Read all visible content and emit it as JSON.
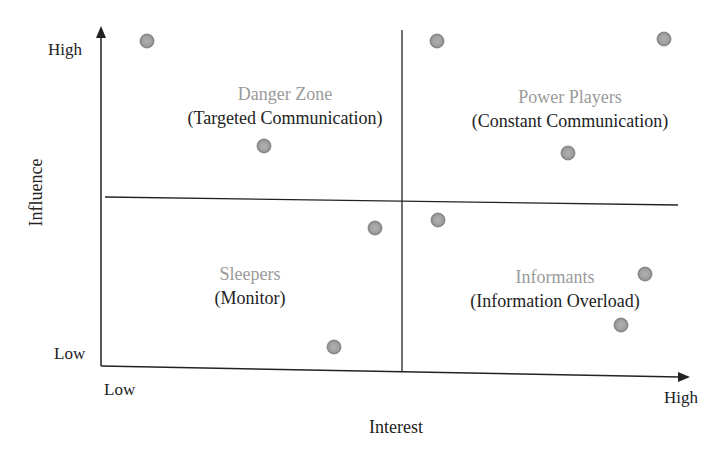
{
  "chart_data": {
    "type": "scatter",
    "title": "",
    "xlabel": "Interest",
    "ylabel": "Influence",
    "x_ticks": [
      "Low",
      "High"
    ],
    "y_ticks": [
      "Low",
      "High"
    ],
    "grid": false,
    "legend": null,
    "quadrants": [
      {
        "position": "top-left",
        "name": "Danger Zone",
        "strategy": "(Targeted Communication)"
      },
      {
        "position": "top-right",
        "name": "Power Players",
        "strategy": "(Constant Communication)"
      },
      {
        "position": "bottom-left",
        "name": "Sleepers",
        "strategy": "(Monitor)"
      },
      {
        "position": "bottom-right",
        "name": "Informants",
        "strategy": "(Information Overload)"
      }
    ],
    "xlim": [
      0,
      10
    ],
    "ylim": [
      0,
      10
    ],
    "points": [
      {
        "x": 0.8,
        "y": 9.7,
        "px": 147,
        "py": 41
      },
      {
        "x": 5.7,
        "y": 9.7,
        "px": 437,
        "py": 41
      },
      {
        "x": 9.5,
        "y": 9.8,
        "px": 664,
        "py": 39
      },
      {
        "x": 2.8,
        "y": 6.6,
        "px": 264,
        "py": 146
      },
      {
        "x": 7.9,
        "y": 6.4,
        "px": 568,
        "py": 153
      },
      {
        "x": 4.6,
        "y": 4.2,
        "px": 375,
        "py": 228
      },
      {
        "x": 5.7,
        "y": 4.4,
        "px": 438,
        "py": 220
      },
      {
        "x": 9.2,
        "y": 2.8,
        "px": 645,
        "py": 274
      },
      {
        "x": 8.8,
        "y": 1.3,
        "px": 621,
        "py": 325
      },
      {
        "x": 4.0,
        "y": 0.7,
        "px": 334,
        "py": 347
      }
    ],
    "point_color": "#a3a3a3",
    "point_edge_color": "#7d7d7d"
  }
}
